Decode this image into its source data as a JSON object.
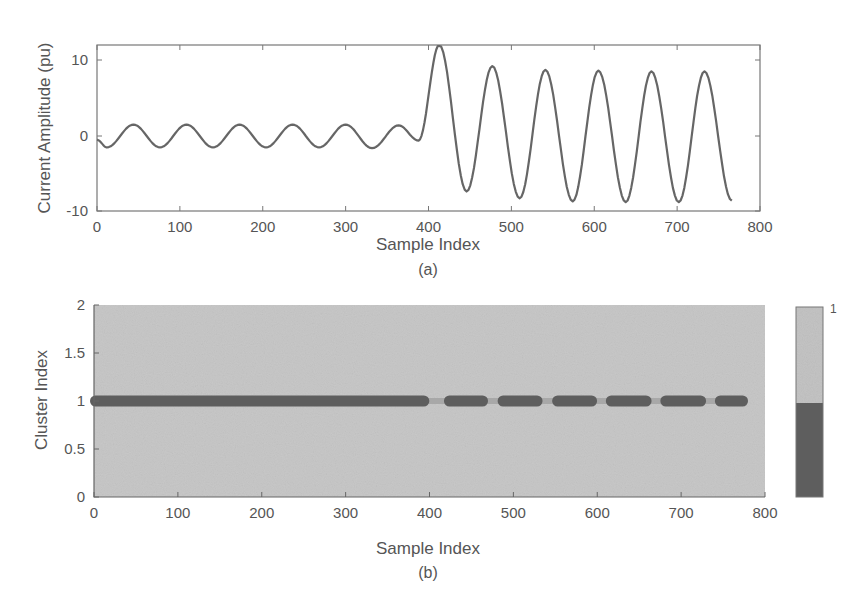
{
  "chart_data": [
    {
      "id": "a",
      "type": "line",
      "caption": "(a)",
      "title": "",
      "xlabel": "Sample Index",
      "ylabel": "Current Amplitude (pu)",
      "xlim": [
        0,
        800
      ],
      "ylim": [
        -10,
        12
      ],
      "xticks": [
        0,
        100,
        200,
        300,
        400,
        500,
        600,
        700,
        800
      ],
      "yticks": [
        -10,
        0,
        10
      ],
      "grid": false,
      "legend": null,
      "series": [
        {
          "name": "current",
          "color": "#666666",
          "description": "Pre-fault sinusoid amplitude ~1.5 pu, period ~64 samples until ~385; fault at ~390 then amplitude jumps to ~12 peak, settling ~8.5 pu",
          "segments": [
            {
              "x_start": 0,
              "x_end": 388,
              "amplitude": 1.5,
              "period": 64,
              "phase_peak_at": 44,
              "offset": 0
            },
            {
              "x_start": 388,
              "x_end": 768,
              "peaks": [
                [
                  413,
                  12
                ],
                [
                  477,
                  9.2
                ],
                [
                  541,
                  8.7
                ],
                [
                  605,
                  8.6
                ],
                [
                  669,
                  8.5
                ],
                [
                  733,
                  8.5
                ]
              ],
              "troughs": [
                [
                  446,
                  -7.3
                ],
                [
                  510,
                  -8.2
                ],
                [
                  574,
                  -8.6
                ],
                [
                  638,
                  -8.7
                ],
                [
                  702,
                  -8.7
                ],
                [
                  766,
                  -8.5
                ]
              ]
            }
          ],
          "key_points": [
            [
              0,
              -0.5
            ],
            [
              12,
              -1.5
            ],
            [
              44,
              1.5
            ],
            [
              76,
              -1.5
            ],
            [
              108,
              1.5
            ],
            [
              140,
              -1.5
            ],
            [
              172,
              1.5
            ],
            [
              204,
              -1.5
            ],
            [
              236,
              1.5
            ],
            [
              268,
              -1.5
            ],
            [
              300,
              1.5
            ],
            [
              332,
              -1.6
            ],
            [
              364,
              1.4
            ],
            [
              388,
              -0.6
            ],
            [
              413,
              12
            ],
            [
              446,
              -7.3
            ],
            [
              477,
              9.2
            ],
            [
              510,
              -8.2
            ],
            [
              541,
              8.7
            ],
            [
              574,
              -8.6
            ],
            [
              605,
              8.6
            ],
            [
              638,
              -8.7
            ],
            [
              669,
              8.5
            ],
            [
              702,
              -8.7
            ],
            [
              733,
              8.5
            ],
            [
              766,
              -8.5
            ]
          ]
        }
      ]
    },
    {
      "id": "b",
      "type": "scatter",
      "caption": "(b)",
      "title": "",
      "xlabel": "Sample Index",
      "ylabel": "Cluster Index",
      "xlim": [
        0,
        800
      ],
      "ylim": [
        0,
        2
      ],
      "xticks": [
        0,
        100,
        200,
        300,
        400,
        500,
        600,
        700,
        800
      ],
      "yticks": [
        0,
        0.5,
        1,
        1.5,
        2
      ],
      "ytick_labels": [
        "0",
        "0.5",
        "1",
        "1.5",
        "2"
      ],
      "grid": false,
      "background_color": "#c8c8c8",
      "series": [
        {
          "name": "cluster 1 (dark)",
          "color": "#5e5e5e",
          "y": 1,
          "x_ranges": [
            [
              0,
              395
            ],
            [
              422,
              465
            ],
            [
              486,
              530
            ],
            [
              551,
              595
            ],
            [
              615,
              660
            ],
            [
              680,
              725
            ],
            [
              745,
              775
            ]
          ]
        },
        {
          "name": "cluster 1 (light, transitional)",
          "color": "#a8a8a8",
          "y": 1,
          "x_ranges": [
            [
              395,
              422
            ],
            [
              465,
              486
            ],
            [
              530,
              551
            ],
            [
              595,
              615
            ],
            [
              660,
              680
            ],
            [
              725,
              745
            ]
          ]
        }
      ],
      "colorbar": {
        "label_top": "1",
        "colors": [
          "#c4c4c4",
          "#5e5e5e"
        ],
        "split_fraction": 0.5
      }
    }
  ]
}
